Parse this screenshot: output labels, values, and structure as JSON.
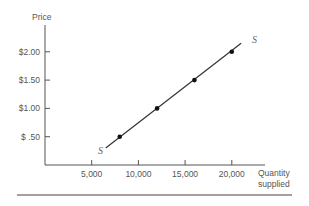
{
  "chart_data": {
    "type": "line",
    "title": "",
    "ylabel": "Price",
    "xlabel": [
      "Quantity",
      "supplied"
    ],
    "xlim": [
      0,
      25000
    ],
    "ylim": [
      0,
      2.5
    ],
    "grid": false,
    "x_ticks": [
      5000,
      10000,
      15000,
      20000
    ],
    "x_tick_labels": [
      "5,000",
      "10,000",
      "15,000",
      "20,000"
    ],
    "y_ticks": [
      0.5,
      1.0,
      1.5,
      2.0
    ],
    "y_tick_labels": [
      "$ .50",
      "$1.00",
      "$1.50",
      "$2.00"
    ],
    "series": [
      {
        "name": "S",
        "x": [
          8000,
          12000,
          16000,
          20000
        ],
        "y": [
          0.5,
          1.0,
          1.5,
          2.0
        ],
        "line_extent": {
          "x": [
            6500,
            21000
          ],
          "y": [
            0.3,
            2.15
          ]
        }
      }
    ],
    "curve_labels": [
      "S",
      "S"
    ],
    "colors": {
      "line": "#333333",
      "axis": "#555555",
      "text": "#555555"
    }
  }
}
